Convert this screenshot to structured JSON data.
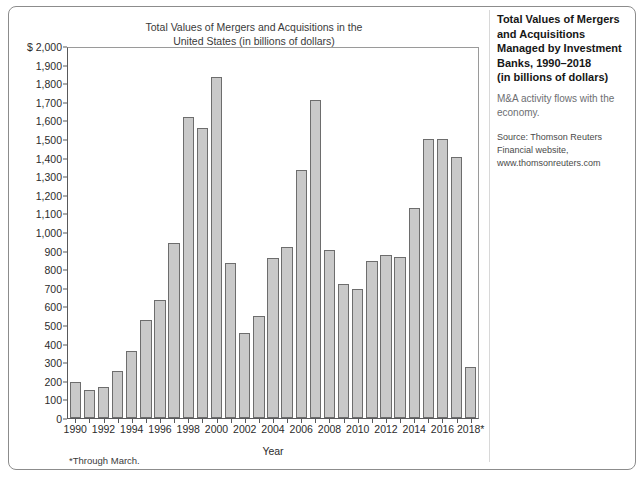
{
  "sidebar": {
    "title": "Total Values of Mergers and Acquisitions Managed by Investment Banks, 1990–2018 (in billions of dollars)",
    "title_lines": [
      "Total Values of Mergers",
      "and Acquisitions",
      "Managed by Investment",
      "Banks, 1990–2018",
      "(in billions of dollars)"
    ],
    "subtitle": "M&A activity flows with the economy.",
    "source_lines": [
      "Source: Thomson Reuters",
      "Financial website,",
      "www.thomsonreuters.com"
    ]
  },
  "footnote": "*Through March.",
  "chart_data": {
    "type": "bar",
    "title": "Total Values of Mergers and Acquisitions in the United States (in billions of dollars)",
    "title_lines": [
      "Total Values of Mergers and Acquisitions in the",
      "United States (in billions of dollars)"
    ],
    "xlabel": "Year",
    "ylabel": "",
    "y_axis_prefix": "$",
    "ylim": [
      0,
      2000
    ],
    "ytick_step": 100,
    "yticks": [
      0,
      100,
      200,
      300,
      400,
      500,
      600,
      700,
      800,
      900,
      1000,
      1100,
      1200,
      1300,
      1400,
      1500,
      1600,
      1700,
      1800,
      1900,
      2000
    ],
    "ytick_labels": [
      "0",
      "100",
      "200",
      "300",
      "400",
      "500",
      "600",
      "700",
      "800",
      "900",
      "1,000",
      "1,100",
      "1,200",
      "1,300",
      "1,400",
      "1,500",
      "1,600",
      "1,700",
      "1,800",
      "1,900",
      "$ 2,000"
    ],
    "grid": false,
    "legend": null,
    "bar_color": "#c9c9c9",
    "bar_border_color": "#6d6d6d",
    "categories": [
      "1990",
      "1991",
      "1992",
      "1993",
      "1994",
      "1995",
      "1996",
      "1997",
      "1998",
      "1999",
      "2000",
      "2001",
      "2002",
      "2003",
      "2004",
      "2005",
      "2006",
      "2007",
      "2008",
      "2009",
      "2010",
      "2011",
      "2012",
      "2013",
      "2014",
      "2015",
      "2016",
      "2017",
      "2018"
    ],
    "xtick_labels": [
      "1990",
      "",
      "1992",
      "",
      "1994",
      "",
      "1996",
      "",
      "1998",
      "",
      "2000",
      "",
      "2002",
      "",
      "2004",
      "",
      "2006",
      "",
      "2008",
      "",
      "2010",
      "",
      "2012",
      "",
      "2014",
      "",
      "2016",
      "",
      "2018*"
    ],
    "values": [
      195,
      150,
      168,
      250,
      358,
      525,
      635,
      940,
      1615,
      1560,
      1830,
      835,
      455,
      550,
      858,
      920,
      1330,
      1710,
      900,
      718,
      690,
      845,
      878,
      862,
      1130,
      1498,
      1498,
      1400,
      275
    ],
    "annotations": [
      "*Through March."
    ]
  }
}
